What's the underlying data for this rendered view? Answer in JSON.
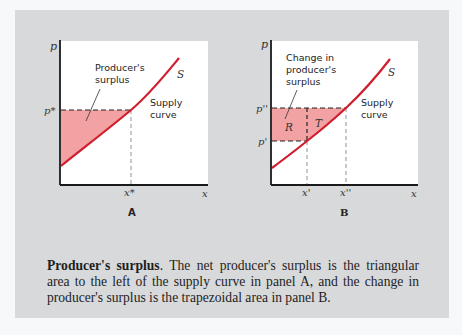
{
  "figure": {
    "background_color": "#d8d9db",
    "fill_color": "#f2a2a2",
    "curve_color": "#d01e2e",
    "panel_a": {
      "label": "A",
      "y_axis_label": "p",
      "x_axis_label": "x",
      "price_tick": "p*",
      "quantity_tick": "x*",
      "curve_label": "S",
      "curve_annotation": "Supply curve",
      "area_annotation": "Producer's surplus"
    },
    "panel_b": {
      "label": "B",
      "y_axis_label": "p",
      "x_axis_label": "x",
      "price_ticks": [
        "p''",
        "p'"
      ],
      "quantity_ticks": [
        "x'",
        "x''"
      ],
      "curve_label": "S",
      "curve_annotation": "Supply curve",
      "area_annotation": "Change in producer's surplus",
      "region_labels": [
        "R",
        "T"
      ]
    }
  },
  "caption": {
    "title": "Producer's surplus",
    "text": ". The net producer's surplus is the triangular area to the left of the supply curve in panel A, and the change in producer's surplus is the trapezoidal area in panel B."
  }
}
